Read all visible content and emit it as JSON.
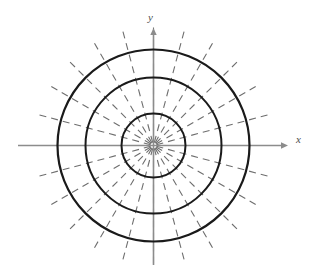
{
  "figure": {
    "background_color": "#ffffff",
    "width": 315,
    "height": 269
  },
  "axes": {
    "x_label": "x",
    "y_label": "y",
    "axis_color": "#8c8c8c",
    "x_axis": {
      "name": "x-axis",
      "x_start": 18,
      "x_end": 288,
      "y": 145.5,
      "arrow_end": "right"
    },
    "y_axis": {
      "name": "y-axis",
      "y_start": 28,
      "y_end": 265,
      "x": 153.5,
      "arrow_end": "up"
    },
    "x_label_pos": {
      "x": 296,
      "y": 143
    },
    "y_label_pos": {
      "x": 148,
      "y": 21
    }
  },
  "chart_data": {
    "type": "line",
    "xlabel": "x",
    "ylabel": "y",
    "center": {
      "x": 153.5,
      "y": 145.5
    },
    "circles": [
      {
        "name": "inner-circle",
        "radius": 32,
        "stroke": "#1a1a1a",
        "stroke_width": 2
      },
      {
        "name": "middle-circle",
        "radius": 68,
        "stroke": "#1a1a1a",
        "stroke_width": 2
      },
      {
        "name": "outer-circle",
        "radius": 96,
        "stroke": "#1a1a1a",
        "stroke_width": 2.2
      }
    ],
    "rays": {
      "count": 24,
      "angle_step_degrees": 15,
      "start_angle_degrees": 15,
      "inner_radius": 3,
      "outer_radius": 119,
      "stroke": "#6e6e6e",
      "stroke_width": 1.1,
      "dash_pattern": "7,5",
      "angles_degrees": [
        15,
        30,
        45,
        60,
        75,
        90,
        105,
        120,
        135,
        150,
        165,
        180,
        195,
        210,
        225,
        240,
        255,
        270,
        285,
        300,
        315,
        330,
        345,
        360
      ]
    },
    "grid": true,
    "legend": "none",
    "xlim": [
      -119,
      119
    ],
    "ylim": [
      -119,
      119
    ]
  }
}
